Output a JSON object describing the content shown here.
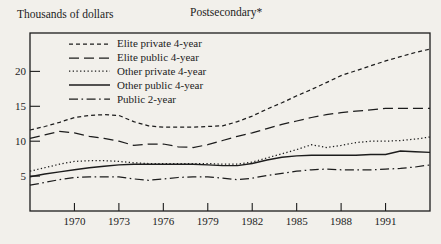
{
  "page": {
    "background": "#f2f0eb",
    "ink_color": "#1c1c1c"
  },
  "header": {
    "y_axis_title": "Thousands of dollars",
    "chart_title": "Postsecondary*"
  },
  "chart_data": {
    "type": "line",
    "title": "Postsecondary*",
    "xlabel": "",
    "ylabel": "Thousands of dollars",
    "xlim": [
      1967,
      1994
    ],
    "ylim": [
      0,
      25.5
    ],
    "xticks": [
      1970,
      1973,
      1976,
      1979,
      1982,
      1985,
      1988,
      1991
    ],
    "yticks": [
      5,
      10,
      15,
      20
    ],
    "grid": false,
    "legend_position": "top-left-inside",
    "x": [
      1967,
      1968,
      1969,
      1970,
      1971,
      1972,
      1973,
      1974,
      1975,
      1976,
      1977,
      1978,
      1979,
      1980,
      1981,
      1982,
      1983,
      1984,
      1985,
      1986,
      1987,
      1988,
      1989,
      1990,
      1991,
      1992,
      1993,
      1994
    ],
    "series": [
      {
        "name": "Elite private 4-year",
        "dash": "small-dash",
        "values": [
          11.6,
          12.1,
          12.7,
          13.4,
          13.7,
          13.8,
          13.7,
          12.8,
          12.2,
          12.0,
          12.0,
          12.0,
          12.1,
          12.2,
          12.8,
          13.6,
          14.6,
          15.5,
          16.5,
          17.4,
          18.4,
          19.4,
          20.1,
          20.8,
          21.5,
          22.1,
          22.7,
          23.2
        ]
      },
      {
        "name": "Elite public 4-year",
        "dash": "long-dash",
        "values": [
          10.4,
          10.9,
          11.4,
          11.2,
          10.7,
          10.4,
          10.0,
          9.4,
          9.6,
          9.6,
          9.2,
          9.1,
          9.5,
          10.1,
          10.7,
          11.2,
          11.8,
          12.4,
          12.9,
          13.4,
          13.8,
          14.1,
          14.3,
          14.5,
          14.7,
          14.7,
          14.7,
          14.7
        ]
      },
      {
        "name": "Other private 4-year",
        "dash": "dotted",
        "values": [
          5.7,
          6.2,
          6.7,
          7.1,
          7.2,
          7.2,
          7.1,
          6.9,
          6.8,
          6.8,
          6.8,
          6.8,
          6.8,
          6.7,
          6.7,
          7.0,
          7.6,
          8.2,
          8.8,
          9.5,
          9.1,
          9.4,
          9.8,
          10.0,
          10.0,
          10.1,
          10.3,
          10.6
        ]
      },
      {
        "name": "Other public 4-year",
        "dash": "solid",
        "values": [
          4.9,
          5.3,
          5.6,
          5.9,
          6.2,
          6.4,
          6.6,
          6.7,
          6.7,
          6.7,
          6.7,
          6.7,
          6.6,
          6.5,
          6.5,
          6.8,
          7.3,
          7.7,
          7.9,
          8.0,
          8.0,
          8.0,
          8.0,
          8.1,
          8.1,
          8.6,
          8.5,
          8.4
        ]
      },
      {
        "name": "Public 2-year",
        "dash": "dash-dot",
        "values": [
          3.7,
          4.1,
          4.5,
          4.8,
          4.9,
          4.9,
          4.9,
          4.6,
          4.4,
          4.6,
          4.8,
          4.9,
          4.9,
          4.7,
          4.5,
          4.7,
          5.1,
          5.4,
          5.7,
          5.9,
          6.0,
          5.9,
          5.9,
          5.9,
          6.0,
          6.1,
          6.3,
          6.6
        ]
      }
    ]
  }
}
